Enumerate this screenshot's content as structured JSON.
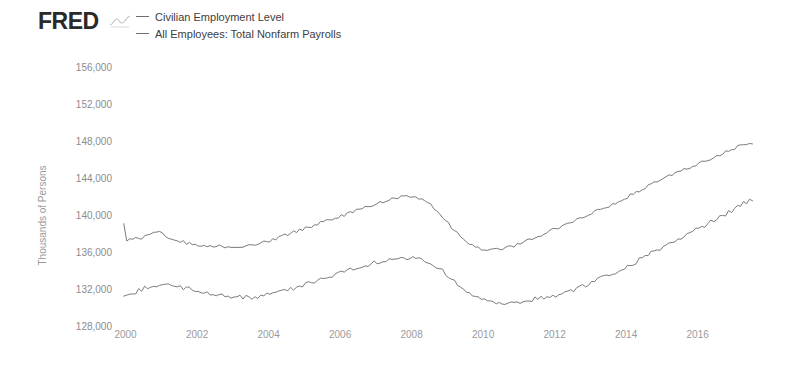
{
  "brand": {
    "name": "FRED",
    "squiggle_icon": "fred-squiggle-icon"
  },
  "legend": {
    "position": "top-left",
    "items": [
      {
        "label": "Civilian Employment Level",
        "color": "#6e6e6e"
      },
      {
        "label": "All Employees: Total Nonfarm Payrolls",
        "color": "#6e6e6e"
      }
    ]
  },
  "axes": {
    "ylabel": "Thousands of Persons",
    "ytick_labels": [
      "156,000",
      "152,000",
      "148,000",
      "144,000",
      "140,000",
      "136,000",
      "132,000",
      "128,000"
    ],
    "xtick_labels": [
      "2000",
      "2002",
      "2004",
      "2006",
      "2008",
      "2010",
      "2012",
      "2014",
      "2016"
    ]
  },
  "chart_data": {
    "type": "line",
    "title": "",
    "subtitle": "",
    "xlabel": "",
    "ylabel": "Thousands of Persons",
    "xlim": [
      1999.9,
      2017.8
    ],
    "ylim": [
      128000,
      156000
    ],
    "yticks": [
      128000,
      132000,
      136000,
      140000,
      144000,
      148000,
      152000,
      156000
    ],
    "xticks": [
      2000,
      2002,
      2004,
      2006,
      2008,
      2010,
      2012,
      2014,
      2016
    ],
    "grid": false,
    "legend_position": "top-left",
    "series": [
      {
        "name": "All Employees: Total Nonfarm Payrolls",
        "color": "#7a7a7a",
        "x": [
          1999.95,
          2000.0,
          2000.1,
          2000.2,
          2000.3,
          2000.4,
          2000.5,
          2000.6,
          2000.75,
          2000.9,
          2001.0,
          2001.1,
          2001.2,
          2001.3,
          2001.45,
          2001.6,
          2001.8,
          2002.0,
          2002.2,
          2002.4,
          2002.6,
          2002.8,
          2003.0,
          2003.2,
          2003.4,
          2003.6,
          2003.8,
          2004.0,
          2004.3,
          2004.6,
          2004.9,
          2005.2,
          2005.5,
          2005.8,
          2006.1,
          2006.4,
          2006.7,
          2007.0,
          2007.25,
          2007.5,
          2007.75,
          2008.0,
          2008.25,
          2008.5,
          2008.75,
          2009.0,
          2009.25,
          2009.5,
          2009.75,
          2010.0,
          2010.25,
          2010.5,
          2010.75,
          2011.0,
          2011.3,
          2011.6,
          2011.9,
          2012.2,
          2012.5,
          2012.8,
          2013.1,
          2013.4,
          2013.7,
          2014.0,
          2014.3,
          2014.6,
          2014.9,
          2015.2,
          2015.5,
          2015.8,
          2016.1,
          2016.4,
          2016.7,
          2017.0,
          2017.3,
          2017.6
        ],
        "y": [
          139100,
          137200,
          137400,
          137550,
          137700,
          137500,
          137750,
          137950,
          138050,
          138150,
          138200,
          137950,
          137700,
          137500,
          137300,
          137200,
          137000,
          136900,
          136800,
          136750,
          136850,
          136700,
          136750,
          136650,
          136750,
          136900,
          137100,
          137300,
          137700,
          138100,
          138500,
          138900,
          139300,
          139700,
          140100,
          140500,
          140900,
          141300,
          141650,
          141900,
          142100,
          142200,
          141900,
          141300,
          140400,
          139300,
          138200,
          137300,
          136700,
          136400,
          136300,
          136450,
          136650,
          136900,
          137400,
          137900,
          138400,
          138900,
          139400,
          139900,
          140400,
          140900,
          141450,
          142000,
          142600,
          143200,
          143800,
          144300,
          144800,
          145300,
          145800,
          146300,
          146800,
          147300,
          147700,
          147800
        ]
      },
      {
        "name": "Civilian Employment Level",
        "color": "#7a7a7a",
        "x": [
          1999.95,
          2000.2,
          2000.4,
          2000.6,
          2000.8,
          2001.0,
          2001.2,
          2001.4,
          2001.6,
          2001.8,
          2002.0,
          2002.3,
          2002.6,
          2002.9,
          2003.2,
          2003.5,
          2003.8,
          2004.1,
          2004.4,
          2004.7,
          2005.0,
          2005.3,
          2005.6,
          2005.9,
          2006.2,
          2006.5,
          2006.8,
          2007.1,
          2007.4,
          2007.7,
          2008.0,
          2008.3,
          2008.6,
          2008.9,
          2009.2,
          2009.5,
          2009.8,
          2010.1,
          2010.4,
          2010.7,
          2011.0,
          2011.3,
          2011.6,
          2011.9,
          2012.2,
          2012.5,
          2012.8,
          2013.1,
          2013.4,
          2013.7,
          2014.0,
          2014.3,
          2014.6,
          2014.9,
          2015.2,
          2015.5,
          2015.8,
          2016.1,
          2016.4,
          2016.7,
          2017.0,
          2017.3,
          2017.6
        ],
        "y": [
          131300,
          131600,
          132000,
          132350,
          132550,
          132650,
          132600,
          132450,
          132250,
          132050,
          131850,
          131600,
          131450,
          131350,
          131250,
          131200,
          131350,
          131600,
          131900,
          132200,
          132550,
          132900,
          133300,
          133700,
          134100,
          134450,
          134800,
          135100,
          135350,
          135500,
          135500,
          135200,
          134700,
          134000,
          133000,
          132000,
          131300,
          130800,
          130600,
          130550,
          130650,
          130900,
          131200,
          131300,
          131600,
          132000,
          132400,
          132900,
          133400,
          133900,
          134500,
          135100,
          135800,
          136400,
          137000,
          137600,
          138200,
          138800,
          139400,
          140000,
          140700,
          141400,
          141900
        ]
      }
    ]
  }
}
